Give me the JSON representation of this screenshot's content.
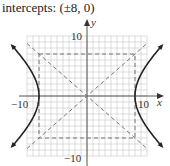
{
  "caption": "intercepts: (±8, 0)",
  "chart_data": {
    "type": "line",
    "title": "intercepts: (±8, 0)",
    "xlabel": "x",
    "ylabel": "y",
    "xlim": [
      -10,
      10
    ],
    "ylim": [
      -10,
      10
    ],
    "grid": true,
    "tick_labels": {
      "x": [
        "-10",
        "10"
      ],
      "y": [
        "10",
        "-10"
      ]
    },
    "series": [
      {
        "name": "hyperbola",
        "equation": "x^2/64 - y^2/49 = 1",
        "style": "solid",
        "vertices": [
          [
            -8,
            0
          ],
          [
            8,
            0
          ]
        ]
      },
      {
        "name": "asymptote 1",
        "equation": "y = 7x/8",
        "style": "dashed"
      },
      {
        "name": "asymptote 2",
        "equation": "y = -7x/8",
        "style": "dashed"
      },
      {
        "name": "central rectangle",
        "corners": [
          [
            -8,
            7
          ],
          [
            8,
            7
          ],
          [
            8,
            -7
          ],
          [
            -8,
            -7
          ]
        ],
        "style": "dashed"
      }
    ]
  },
  "axes": {
    "x_label": "x",
    "y_label": "y",
    "x_min_label": "−10",
    "x_max_label": "10",
    "y_max_label": "10",
    "y_min_label": "−10"
  }
}
